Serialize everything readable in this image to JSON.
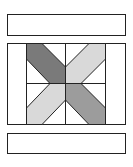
{
  "diagram": {
    "title": "",
    "type": "quilt-block",
    "colors": {
      "background": "#ffffff",
      "stroke": "#222222",
      "dark": "#7a7a7a",
      "medium": "#9c9c9c",
      "light": "#d9d9d9"
    },
    "parts": [
      {
        "name": "top-border-strip",
        "fill": "white"
      },
      {
        "name": "center-block",
        "fill": "white"
      },
      {
        "name": "bottom-border-strip",
        "fill": "white"
      }
    ],
    "bands": [
      {
        "quadrant": "top-left",
        "shade": "dark"
      },
      {
        "quadrant": "top-right",
        "shade": "light"
      },
      {
        "quadrant": "bottom-left",
        "shade": "light"
      },
      {
        "quadrant": "bottom-right",
        "shade": "medium"
      }
    ]
  }
}
